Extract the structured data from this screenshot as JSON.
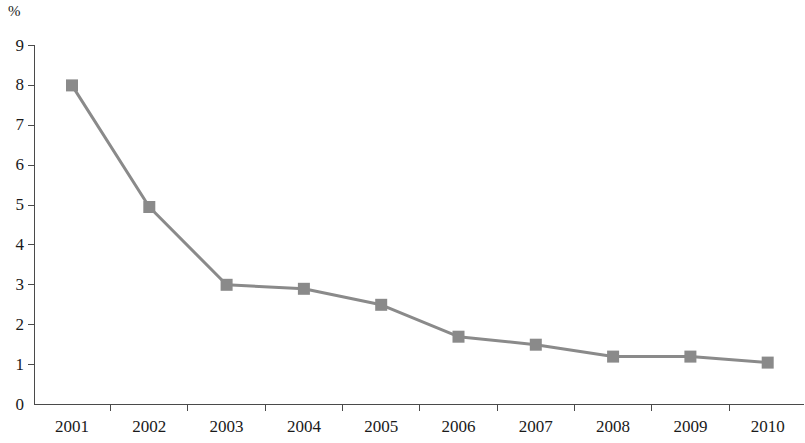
{
  "chart_data": {
    "type": "line",
    "title": "",
    "subtitle": "",
    "xlabel": "",
    "ylabel": "%",
    "unit_label": "%",
    "categories": [
      "2001",
      "2002",
      "2003",
      "2004",
      "2005",
      "2006",
      "2007",
      "2008",
      "2009",
      "2010"
    ],
    "series": [
      {
        "name": "",
        "values": [
          8.0,
          4.95,
          3.0,
          2.9,
          2.5,
          1.7,
          1.5,
          1.2,
          1.2,
          1.05
        ],
        "color": "#8a8a8a",
        "marker": "square",
        "line_width": 3
      }
    ],
    "ylim": [
      0,
      9
    ],
    "yticks": [
      "0",
      "1",
      "2",
      "3",
      "4",
      "5",
      "6",
      "7",
      "8",
      "9"
    ],
    "ytick_values": [
      0,
      1,
      2,
      3,
      4,
      5,
      6,
      7,
      8,
      9
    ],
    "grid": false,
    "legend": null,
    "legend_position": "none",
    "axis_color": "#4a4a4a",
    "annotations": []
  },
  "axes": {
    "y_axis_name": "percent-axis",
    "x_axis_name": "year-axis"
  }
}
